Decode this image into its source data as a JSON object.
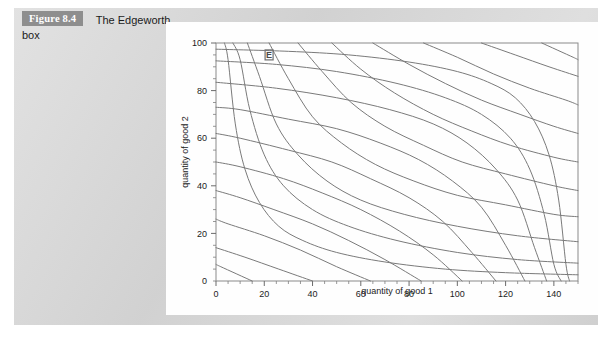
{
  "caption": {
    "figure_tag": "Figure 8.4",
    "title_line1": "The Edgeworth",
    "title_line2": "box"
  },
  "chart_data": {
    "type": "line",
    "title": "",
    "xlabel": "quantity of good 1",
    "ylabel": "quantity of good 2",
    "xlim": [
      0,
      150
    ],
    "ylim": [
      0,
      100
    ],
    "xticks": [
      0,
      20,
      40,
      60,
      80,
      100,
      120,
      140
    ],
    "yticks": [
      20,
      40,
      60,
      80,
      100
    ],
    "xtick_labels": [
      "0",
      "20",
      "40",
      "60",
      "80",
      "100",
      "120",
      "140"
    ],
    "ytick_labels": [
      "20",
      "40",
      "60",
      "80",
      "100"
    ],
    "minor_tick_step": 5,
    "grid": false,
    "legend": null,
    "annotations": [
      {
        "label": "E",
        "x": 22,
        "y": 95
      }
    ],
    "series": [
      {
        "name": "consumer A indifference curves",
        "origin": "bottom-left",
        "color": "#7a7a7a",
        "note": "convex to origin at lower-left; utility rises up-right",
        "curves": [
          {
            "k": 350,
            "points": [
              [
                3.5,
                100
              ],
              [
                5,
                93
              ],
              [
                8,
                66
              ],
              [
                12,
                47
              ],
              [
                18,
                33
              ],
              [
                26,
                23
              ],
              [
                36,
                17
              ],
              [
                50,
                12
              ],
              [
                70,
                8
              ],
              [
                95,
                5
              ],
              [
                120,
                3.5
              ],
              [
                150,
                2.6
              ]
            ]
          },
          {
            "k": 700,
            "points": [
              [
                7,
                100
              ],
              [
                10,
                93
              ],
              [
                14,
                72
              ],
              [
                20,
                53
              ],
              [
                28,
                40
              ],
              [
                40,
                30
              ],
              [
                55,
                23
              ],
              [
                75,
                17
              ],
              [
                100,
                12
              ],
              [
                125,
                9
              ],
              [
                150,
                7.5
              ]
            ]
          },
          {
            "k": 1300,
            "points": [
              [
                13,
                100
              ],
              [
                18,
                86
              ],
              [
                25,
                66
              ],
              [
                34,
                53
              ],
              [
                46,
                42
              ],
              [
                60,
                34
              ],
              [
                78,
                28
              ],
              [
                100,
                23
              ],
              [
                125,
                19
              ],
              [
                150,
                16.5
              ]
            ]
          },
          {
            "k": 2200,
            "points": [
              [
                22,
                100
              ],
              [
                30,
                85
              ],
              [
                40,
                69
              ],
              [
                52,
                58
              ],
              [
                66,
                49
              ],
              [
                82,
                42
              ],
              [
                100,
                36
              ],
              [
                120,
                32
              ],
              [
                140,
                28
              ],
              [
                150,
                27
              ]
            ]
          },
          {
            "k": 3400,
            "points": [
              [
                34,
                100
              ],
              [
                44,
                88
              ],
              [
                56,
                75
              ],
              [
                70,
                65
              ],
              [
                86,
                57
              ],
              [
                102,
                50
              ],
              [
                120,
                45
              ],
              [
                140,
                40
              ],
              [
                150,
                38
              ]
            ]
          },
          {
            "k": 4800,
            "points": [
              [
                48,
                100
              ],
              [
                60,
                89
              ],
              [
                74,
                79
              ],
              [
                90,
                70
              ],
              [
                106,
                63
              ],
              [
                122,
                57
              ],
              [
                140,
                52
              ],
              [
                150,
                50
              ]
            ]
          },
          {
            "k": 6500,
            "points": [
              [
                65,
                100
              ],
              [
                80,
                91
              ],
              [
                95,
                83
              ],
              [
                110,
                76
              ],
              [
                126,
                70
              ],
              [
                140,
                65
              ],
              [
                150,
                62
              ]
            ]
          },
          {
            "k": 8600,
            "points": [
              [
                86,
                100
              ],
              [
                100,
                94
              ],
              [
                115,
                87
              ],
              [
                130,
                81
              ],
              [
                145,
                76
              ],
              [
                150,
                74
              ]
            ]
          },
          {
            "k": 11000,
            "points": [
              [
                110,
                100
              ],
              [
                124,
                95
              ],
              [
                138,
                90
              ],
              [
                150,
                86
              ]
            ]
          },
          {
            "k": 13500,
            "points": [
              [
                135,
                100
              ],
              [
                148,
                94
              ],
              [
                150,
                93
              ]
            ]
          }
        ]
      },
      {
        "name": "consumer B indifference curves",
        "origin": "top-right",
        "color": "#7a7a7a",
        "note": "rotated 180 degrees; convex to the upper-right corner",
        "curves": [
          {
            "k": 350,
            "points": [
              [
                146.5,
                0
              ],
              [
                145,
                7
              ],
              [
                142,
                34
              ],
              [
                138,
                53
              ],
              [
                132,
                67
              ],
              [
                124,
                77
              ],
              [
                114,
                83
              ],
              [
                100,
                88
              ],
              [
                80,
                92
              ],
              [
                55,
                95
              ],
              [
                30,
                96.5
              ],
              [
                0,
                97.4
              ]
            ]
          },
          {
            "k": 700,
            "points": [
              [
                143,
                0
              ],
              [
                140,
                7
              ],
              [
                136,
                28
              ],
              [
                130,
                47
              ],
              [
                122,
                60
              ],
              [
                110,
                70
              ],
              [
                95,
                77
              ],
              [
                75,
                83
              ],
              [
                50,
                88
              ],
              [
                25,
                91
              ],
              [
                0,
                92.5
              ]
            ]
          },
          {
            "k": 1300,
            "points": [
              [
                137,
                0
              ],
              [
                132,
                14
              ],
              [
                125,
                34
              ],
              [
                116,
                47
              ],
              [
                104,
                58
              ],
              [
                90,
                66
              ],
              [
                72,
                72
              ],
              [
                50,
                77
              ],
              [
                25,
                81
              ],
              [
                0,
                83.5
              ]
            ]
          },
          {
            "k": 2200,
            "points": [
              [
                128,
                0
              ],
              [
                120,
                15
              ],
              [
                110,
                31
              ],
              [
                98,
                42
              ],
              [
                84,
                51
              ],
              [
                68,
                58
              ],
              [
                50,
                64
              ],
              [
                30,
                68
              ],
              [
                10,
                72
              ],
              [
                0,
                73
              ]
            ]
          },
          {
            "k": 3400,
            "points": [
              [
                116,
                0
              ],
              [
                106,
                12
              ],
              [
                94,
                25
              ],
              [
                80,
                35
              ],
              [
                64,
                43
              ],
              [
                48,
                50
              ],
              [
                30,
                55
              ],
              [
                10,
                60
              ],
              [
                0,
                62
              ]
            ]
          },
          {
            "k": 4800,
            "points": [
              [
                102,
                0
              ],
              [
                90,
                11
              ],
              [
                76,
                21
              ],
              [
                60,
                30
              ],
              [
                44,
                37
              ],
              [
                28,
                43
              ],
              [
                10,
                48
              ],
              [
                0,
                50
              ]
            ]
          },
          {
            "k": 6500,
            "points": [
              [
                85,
                0
              ],
              [
                70,
                9
              ],
              [
                55,
                17
              ],
              [
                40,
                24
              ],
              [
                24,
                30
              ],
              [
                10,
                35
              ],
              [
                0,
                38
              ]
            ]
          },
          {
            "k": 8600,
            "points": [
              [
                64,
                0
              ],
              [
                50,
                6
              ],
              [
                35,
                13
              ],
              [
                20,
                19
              ],
              [
                5,
                24
              ],
              [
                0,
                26
              ]
            ]
          },
          {
            "k": 11000,
            "points": [
              [
                40,
                0
              ],
              [
                26,
                5
              ],
              [
                12,
                10
              ],
              [
                0,
                14
              ]
            ]
          },
          {
            "k": 13500,
            "points": [
              [
                15,
                0
              ],
              [
                2,
                6
              ],
              [
                0,
                7
              ]
            ]
          }
        ]
      }
    ]
  }
}
